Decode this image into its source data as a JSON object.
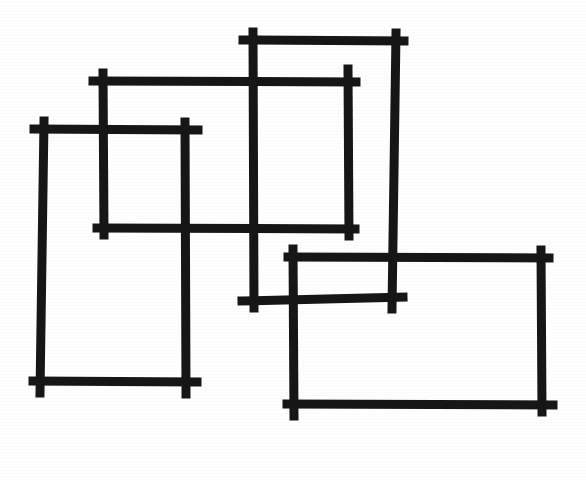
{
  "figure": {
    "canvas": {
      "width": 586,
      "height": 480,
      "background_color": "#fefefe"
    },
    "style": {
      "stroke_color": "#161616",
      "stroke_width": 9,
      "stroke_cap": "square",
      "overshoot_px": 9
    }
  },
  "chart_data": {
    "type": "scatter",
    "xlabel": "",
    "ylabel": "",
    "xlim": [
      0,
      586
    ],
    "ylim": [
      0,
      480
    ],
    "grid": false,
    "legend": "none",
    "shapes": [
      {
        "name": "tall-left-rectangle",
        "shape": "rectangle",
        "x": 42,
        "y": 130,
        "width": 145,
        "height": 253,
        "x2": 187,
        "y2": 383,
        "stroke": "#161616",
        "fill": "none"
      },
      {
        "name": "upper-left-wide-rectangle",
        "shape": "rectangle",
        "x": 104,
        "y": 80,
        "width": 244,
        "height": 148,
        "x2": 348,
        "y2": 228,
        "stroke": "#161616",
        "fill": "none"
      },
      {
        "name": "upper-right-tall-rectangle",
        "shape": "rectangle",
        "x": 252,
        "y": 42,
        "width": 142,
        "height": 257,
        "x2": 394,
        "y2": 299,
        "stroke": "#161616",
        "fill": "none"
      },
      {
        "name": "lower-right-wide-rectangle",
        "shape": "rectangle",
        "x": 295,
        "y": 257,
        "width": 247,
        "height": 148,
        "x2": 542,
        "y2": 405,
        "stroke": "#161616",
        "fill": "none"
      }
    ],
    "shape_count": 4
  }
}
